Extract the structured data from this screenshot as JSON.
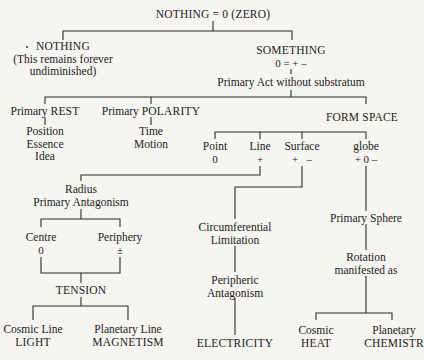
{
  "diagram": {
    "root": {
      "title": "NOTHING = 0 (ZERO)"
    },
    "nothing": {
      "title": "NOTHING",
      "note_line1": "(This remains forever",
      "note_line2": "undiminished)"
    },
    "something": {
      "title": "SOMETHING",
      "formula": "0 = + –",
      "act": "Primary Act without substratum"
    },
    "rest": {
      "prefix": "Primary ",
      "title": "REST",
      "items": [
        "Position",
        "Essence",
        "Idea"
      ]
    },
    "polarity": {
      "prefix": "Primary ",
      "title": "POLARITY",
      "items": [
        "Time",
        "Motion"
      ]
    },
    "form_space": {
      "title": "FORM SPACE",
      "children": [
        {
          "label": "Point",
          "symbol": "0"
        },
        {
          "label": "Line",
          "symbol": "+"
        },
        {
          "label": "Surface",
          "symbol": "+   –"
        },
        {
          "label": "globe",
          "symbol": "+ 0 –"
        }
      ]
    },
    "radius": {
      "line1": "Radius",
      "line2": "Primary Antagonism",
      "centre": {
        "label": "Centre",
        "symbol": "0"
      },
      "periphery": {
        "label": "Periphery",
        "symbol": "±"
      },
      "tension": "TENSION",
      "cosmic_line": {
        "label": "Cosmic Line",
        "result": "LIGHT"
      },
      "planetary_line": {
        "label": "Planetary Line",
        "result": "MAGNETISM"
      }
    },
    "surface_branch": {
      "limitation_line1": "Circumferential",
      "limitation_line2": "Limitation",
      "antagonism_line1": "Peripheric",
      "antagonism_line2": "Antagonism",
      "result": "ELECTRICITY"
    },
    "globe_branch": {
      "sphere": "Primary Sphere",
      "rotation_line1": "Rotation",
      "rotation_line2": "manifested as",
      "cosmic": {
        "label": "Cosmic",
        "result": "HEAT"
      },
      "planetary": {
        "label": "Planetary",
        "result": "CHEMISTR"
      }
    }
  }
}
